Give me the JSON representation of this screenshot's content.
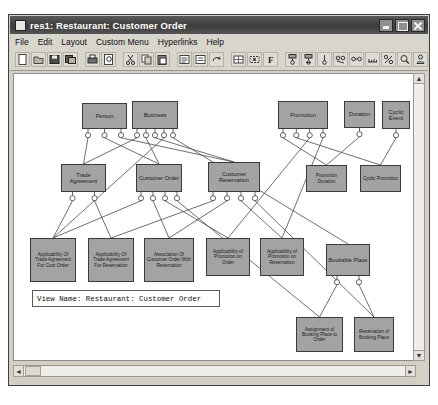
{
  "window": {
    "title": "res1: Restaurant: Customer Order",
    "icon": "app-icon",
    "buttons": {
      "minimize": "_",
      "maximize": "□",
      "close": "✕"
    }
  },
  "menubar": {
    "items": [
      {
        "label": "File"
      },
      {
        "label": "Edit"
      },
      {
        "label": "Layout"
      },
      {
        "label": "Custom Menu"
      },
      {
        "label": "Hyperlinks"
      },
      {
        "label": "Help"
      }
    ]
  },
  "toolbar": {
    "buttons": [
      {
        "name": "new-icon"
      },
      {
        "name": "open-icon"
      },
      {
        "name": "save-icon"
      },
      {
        "name": "save-all-icon"
      },
      {
        "name": "print-icon"
      },
      {
        "name": "print-preview-icon"
      },
      {
        "name": "cut-icon"
      },
      {
        "name": "copy-icon"
      },
      {
        "name": "paste-icon"
      },
      {
        "name": "align-left-icon"
      },
      {
        "name": "align-center-icon"
      },
      {
        "name": "undo-icon"
      },
      {
        "name": "grid-icon"
      },
      {
        "name": "select-icon"
      },
      {
        "name": "font-icon"
      },
      {
        "name": "entity-icon"
      },
      {
        "name": "subtype-icon"
      },
      {
        "name": "attribute-icon"
      },
      {
        "name": "relation-icon"
      },
      {
        "name": "link-icon"
      },
      {
        "name": "ruler-icon"
      },
      {
        "name": "percent-icon"
      },
      {
        "name": "zoom-icon"
      },
      {
        "name": "person-icon"
      }
    ]
  },
  "canvas": {
    "view_label": "View Name: Restaurant: Customer Order",
    "nodes": [
      {
        "id": "person",
        "label": "Person",
        "x": 68,
        "y": 29,
        "w": 45,
        "h": 26,
        "size": "big"
      },
      {
        "id": "business",
        "label": "Business",
        "x": 118,
        "y": 27,
        "w": 46,
        "h": 28,
        "size": "big"
      },
      {
        "id": "promotion",
        "label": "Promotion",
        "x": 264,
        "y": 27,
        "w": 50,
        "h": 28,
        "size": "big"
      },
      {
        "id": "duration",
        "label": "Duration",
        "x": 330,
        "y": 27,
        "w": 31,
        "h": 27,
        "size": "big"
      },
      {
        "id": "cyclic-event",
        "label": "Cyclic Event",
        "x": 368,
        "y": 27,
        "w": 28,
        "h": 28,
        "size": "big"
      },
      {
        "id": "trade-agreement",
        "label": "Trade Agreement",
        "x": 47,
        "y": 90,
        "w": 45,
        "h": 28,
        "size": "big"
      },
      {
        "id": "customer-order",
        "label": "Customer Order",
        "x": 122,
        "y": 90,
        "w": 46,
        "h": 28,
        "size": "big"
      },
      {
        "id": "customer-reservation",
        "label": "Customer Reservation",
        "x": 194,
        "y": 88,
        "w": 52,
        "h": 30,
        "size": "big"
      },
      {
        "id": "promotion-duration",
        "label": "Promotion Duration",
        "x": 292,
        "y": 91,
        "w": 41,
        "h": 27,
        "size": "sm"
      },
      {
        "id": "cyclic-promotion",
        "label": "Cyclic Promotion",
        "x": 346,
        "y": 91,
        "w": 41,
        "h": 27,
        "size": "sm"
      },
      {
        "id": "app-trade-cust-order",
        "label": "Applicability Of Trade Agreement For Cust Order",
        "x": 16,
        "y": 164,
        "w": 46,
        "h": 44,
        "size": "sm"
      },
      {
        "id": "app-trade-reservation",
        "label": "Applicability Of Trade Agreement For Reservation",
        "x": 74,
        "y": 164,
        "w": 46,
        "h": 44,
        "size": "sm"
      },
      {
        "id": "assoc-order-reservation",
        "label": "Association Of Customer Order With Reservation",
        "x": 130,
        "y": 164,
        "w": 50,
        "h": 44,
        "size": "sm"
      },
      {
        "id": "app-promo-order",
        "label": "Applicability of Promotion on Order",
        "x": 192,
        "y": 164,
        "w": 44,
        "h": 38,
        "size": "sm"
      },
      {
        "id": "app-promo-reservation",
        "label": "Applicability of Promotion on Reservation",
        "x": 246,
        "y": 164,
        "w": 44,
        "h": 38,
        "size": "sm"
      },
      {
        "id": "bookable-place",
        "label": "Bookable Place",
        "x": 312,
        "y": 170,
        "w": 44,
        "h": 32,
        "size": "big"
      },
      {
        "id": "assign-booking-order",
        "label": "Assignment of Booking Place to Order",
        "x": 282,
        "y": 243,
        "w": 47,
        "h": 35,
        "size": "sm"
      },
      {
        "id": "reservation-booking",
        "label": "Reservation of Booking Place",
        "x": 340,
        "y": 243,
        "w": 40,
        "h": 35,
        "size": "sm"
      }
    ]
  },
  "scrollbars": {
    "vertical": {
      "up": "▲",
      "down": "▼"
    },
    "horizontal": {
      "left": "◄",
      "right": "►"
    }
  }
}
